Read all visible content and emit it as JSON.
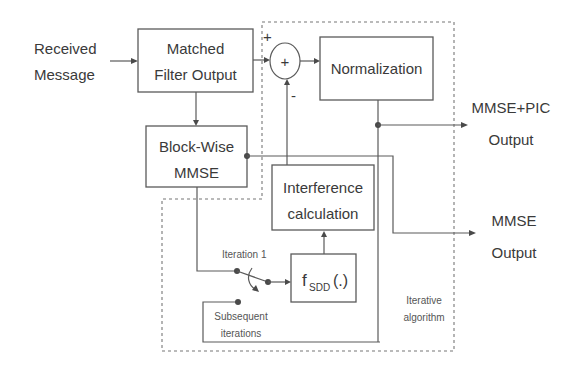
{
  "diagram": {
    "type": "block-diagram",
    "colors": {
      "stroke": "#5a5a5a",
      "text": "#3a3a3a",
      "background": "#ffffff"
    },
    "input": {
      "line1": "Received",
      "line2": "Message"
    },
    "blocks": {
      "matched_filter": {
        "line1": "Matched",
        "line2": "Filter Output"
      },
      "block_wise_mmse": {
        "line1": "Block-Wise",
        "line2": "MMSE"
      },
      "normalization": {
        "label": "Normalization"
      },
      "interference": {
        "line1": "Interference",
        "line2": "calculation"
      },
      "fsdd": {
        "main": "f",
        "sub": "SDD",
        "args": "(.)"
      }
    },
    "summing_junction": {
      "symbol": "+",
      "plus_input": "+",
      "minus_input": "-"
    },
    "switch": {
      "iteration1_label": "Iteration 1",
      "subsequent_line1": "Subsequent",
      "subsequent_line2": "iterations"
    },
    "region": {
      "line1": "Iterative",
      "line2": "algorithm"
    },
    "outputs": {
      "mmse_pic": {
        "line1": "MMSE+PIC",
        "line2": "Output"
      },
      "mmse": {
        "line1": "MMSE",
        "line2": "Output"
      }
    }
  }
}
